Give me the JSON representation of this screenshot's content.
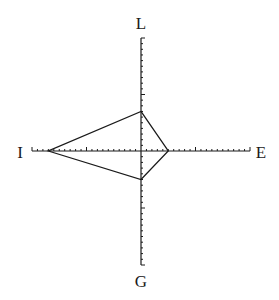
{
  "diagram": {
    "type": "four-axis polygon (radar-style profile)",
    "center": {
      "x": 141,
      "y": 151
    },
    "tick_count_per_half_axis": 20,
    "major_tick_every": 10,
    "colors": {
      "line": "#1a1a1a",
      "background": "#ffffff"
    },
    "axes": {
      "top": {
        "label": "L",
        "value": 7
      },
      "right": {
        "label": "E",
        "value": 5
      },
      "bottom": {
        "label": "G",
        "value": 5
      },
      "left": {
        "label": "I",
        "value": 17
      }
    }
  },
  "chart_data": {
    "type": "radar",
    "title": "",
    "categories": [
      "L",
      "E",
      "G",
      "I"
    ],
    "values": [
      7,
      5,
      5,
      17
    ],
    "axis_range": [
      0,
      20
    ],
    "layout": {
      "L": "top",
      "E": "right",
      "G": "bottom",
      "I": "left"
    }
  }
}
